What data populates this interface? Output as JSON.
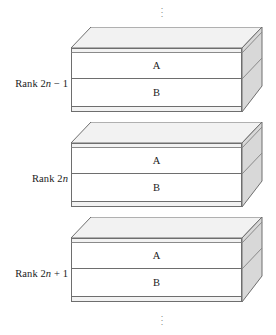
{
  "figure": {
    "type": "3d-stacked-slab-diagram",
    "background_color": "#ffffff",
    "line_color": "#6e6e6e",
    "top_face_color": "#f2f2f2",
    "side_face_color": "#d8d8d8",
    "front_face_color": "#ffffff",
    "text_color": "#1b1b1b"
  },
  "ellipsis": {
    "top": "⋮",
    "bottom": "⋮",
    "dot": "·"
  },
  "slabs": [
    {
      "id": "slab-upper",
      "label_prefix": "Rank 2",
      "label_var": "n",
      "label_suffix": " − 1",
      "label_full": "Rank 2n − 1",
      "layers": [
        {
          "name": "A",
          "letter": "A"
        },
        {
          "name": "B",
          "letter": "B"
        }
      ]
    },
    {
      "id": "slab-middle",
      "label_prefix": "Rank 2",
      "label_var": "n",
      "label_suffix": "",
      "label_full": "Rank 2n",
      "layers": [
        {
          "name": "A",
          "letter": "A"
        },
        {
          "name": "B",
          "letter": "B"
        }
      ]
    },
    {
      "id": "slab-lower",
      "label_prefix": "Rank 2",
      "label_var": "n",
      "label_suffix": " + 1",
      "label_full": "Rank 2n + 1",
      "layers": [
        {
          "name": "A",
          "letter": "A"
        },
        {
          "name": "B",
          "letter": "B"
        }
      ]
    }
  ]
}
